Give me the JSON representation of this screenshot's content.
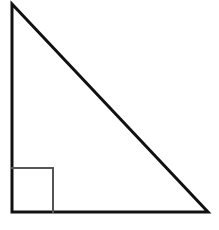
{
  "figure": {
    "type": "geometric-diagram",
    "canvas": {
      "width": 219,
      "height": 230,
      "background_color": "#ffffff"
    },
    "shapes": {
      "triangle": {
        "name": "right-triangle",
        "description": "Right triangle with the right angle at the bottom-left vertex",
        "vertices": [
          {
            "label": "apex",
            "x": 12,
            "y": 4
          },
          {
            "label": "bottom-right",
            "x": 208,
            "y": 212
          },
          {
            "label": "bottom-left",
            "x": 12,
            "y": 212
          }
        ],
        "points_attr": "12,4 208,212 12,212",
        "stroke_color": "#111111",
        "stroke_width": 3,
        "fill": "none"
      },
      "right_angle_marker": {
        "name": "right-angle-square",
        "description": "Small open square marking the 90 degree angle at the bottom-left vertex",
        "points_attr": "12,168 53,168 53,212",
        "x": 12,
        "y": 168,
        "size_width": 41,
        "size_height": 44,
        "stroke_color": "#555555",
        "stroke_width": 2,
        "fill": "none"
      }
    },
    "legs": {
      "vertical_leg": {
        "name": "left-vertical-leg",
        "length_px": 208
      },
      "horizontal_leg": {
        "name": "bottom-horizontal-leg",
        "length_px": 196
      },
      "hypotenuse": {
        "name": "hypotenuse",
        "length_px": 286
      }
    }
  },
  "chart_data": {
    "type": "diagram",
    "xlabel": "",
    "ylabel": "",
    "grid": false,
    "legend": "none",
    "xlim": [
      0,
      219
    ],
    "ylim": [
      0,
      230
    ],
    "elements": [
      {
        "kind": "polygon",
        "name": "right-triangle",
        "closed": true,
        "points": [
          [
            12,
            4
          ],
          [
            208,
            212
          ],
          [
            12,
            212
          ]
        ],
        "stroke": "#111111",
        "stroke_width": 3,
        "fill": "none"
      },
      {
        "kind": "polyline",
        "name": "right-angle-square",
        "closed": false,
        "points": [
          [
            12,
            168
          ],
          [
            53,
            168
          ],
          [
            53,
            212
          ]
        ],
        "stroke": "#555555",
        "stroke_width": 2,
        "fill": "none"
      }
    ],
    "annotations": []
  }
}
